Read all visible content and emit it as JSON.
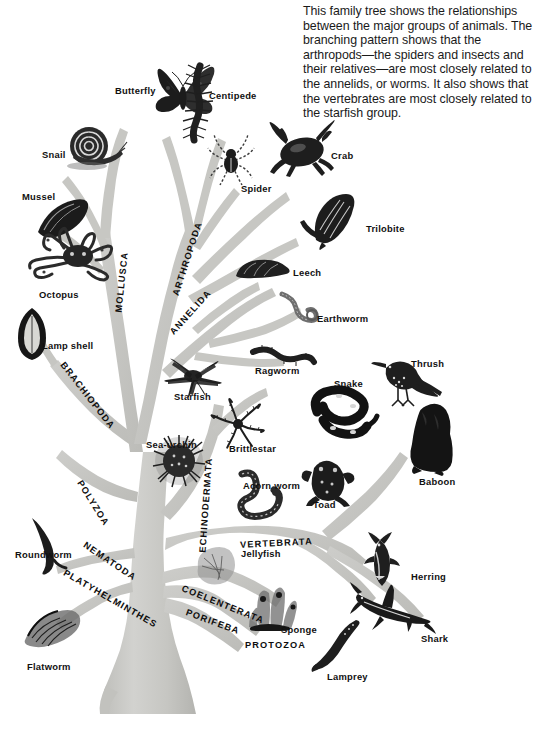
{
  "caption": {
    "text": "This family tree shows the relationships\nbetween the major groups of animals. The\nbranching pattern shows that the\narthropods—the spiders and insects and\ntheir relatives—are most closely related to\nthe annelids, or worms. It also shows that\nthe vertebrates are most closely related to\nthe starfish group."
  },
  "colors": {
    "background": "#ffffff",
    "trunk": "#c8c8c5",
    "trunk_shade": "#b6b6b2",
    "trunk_light": "#d6d6d3",
    "ink": "#1a1a1a",
    "label": "#111111"
  },
  "phyla": [
    {
      "name": "MOLLUSCA",
      "x": 119,
      "y": 308,
      "rotate": -84
    },
    {
      "name": "ARTHROPODA",
      "x": 176,
      "y": 291,
      "rotate": -72
    },
    {
      "name": "ANNELIDA",
      "x": 172,
      "y": 329,
      "rotate": -48
    },
    {
      "name": "BRACHIOPODA",
      "x": 62,
      "y": 359,
      "rotate": 52
    },
    {
      "name": "POLYZOA",
      "x": 79,
      "y": 477,
      "rotate": 58
    },
    {
      "name": "NEMATODA",
      "x": 84,
      "y": 540,
      "rotate": 34
    },
    {
      "name": "PLATYHELMINTHES",
      "x": 64,
      "y": 568,
      "rotate": 30
    },
    {
      "name": "ECHINODERMATA",
      "x": 203,
      "y": 548,
      "rotate": -86
    },
    {
      "name": "VERTEBRATA",
      "x": 240,
      "y": 541,
      "rotate": -3
    },
    {
      "name": "COELENTERATA",
      "x": 182,
      "y": 584,
      "rotate": 22
    },
    {
      "name": "PORIFEBA",
      "x": 186,
      "y": 608,
      "rotate": 20
    },
    {
      "name": "PROTOZOA",
      "x": 245,
      "y": 641,
      "rotate": 0
    }
  ],
  "animals": [
    {
      "name": "Butterfly",
      "label_x": 115,
      "label_y": 86,
      "art_x": 152,
      "art_y": 66,
      "art_w": 68,
      "art_h": 56,
      "kind": "butterfly"
    },
    {
      "name": "Centipede",
      "label_x": 209,
      "label_y": 91,
      "art_x": 178,
      "art_y": 68,
      "art_w": 36,
      "art_h": 72,
      "kind": "centipede"
    },
    {
      "name": "Snail",
      "label_x": 42,
      "label_y": 150,
      "art_x": 65,
      "art_y": 126,
      "art_w": 62,
      "art_h": 46,
      "kind": "snail"
    },
    {
      "name": "Spider",
      "label_x": 241,
      "label_y": 184,
      "art_x": 208,
      "art_y": 134,
      "art_w": 46,
      "art_h": 54,
      "kind": "spider"
    },
    {
      "name": "Crab",
      "label_x": 331,
      "label_y": 151,
      "art_x": 270,
      "art_y": 122,
      "art_w": 62,
      "art_h": 54,
      "kind": "crab"
    },
    {
      "name": "Mussel",
      "label_x": 22,
      "label_y": 192,
      "art_x": 36,
      "art_y": 198,
      "art_w": 56,
      "art_h": 42,
      "kind": "mussel"
    },
    {
      "name": "Trilobite",
      "label_x": 366,
      "label_y": 224,
      "art_x": 303,
      "art_y": 196,
      "art_w": 56,
      "art_h": 52,
      "kind": "trilobite"
    },
    {
      "name": "Octopus",
      "label_x": 39,
      "label_y": 290,
      "art_x": 27,
      "art_y": 232,
      "art_w": 88,
      "art_h": 60,
      "kind": "octopus"
    },
    {
      "name": "Leech",
      "label_x": 293,
      "label_y": 268,
      "art_x": 232,
      "art_y": 258,
      "art_w": 58,
      "art_h": 26,
      "kind": "leech"
    },
    {
      "name": "Earthworm",
      "label_x": 317,
      "label_y": 314,
      "art_x": 279,
      "art_y": 294,
      "art_w": 44,
      "art_h": 34,
      "kind": "earthworm"
    },
    {
      "name": "Lamp shell",
      "label_x": 42,
      "label_y": 341,
      "art_x": 18,
      "art_y": 310,
      "art_w": 30,
      "art_h": 52,
      "kind": "lampshell"
    },
    {
      "name": "Ragworm",
      "label_x": 255,
      "label_y": 366,
      "art_x": 253,
      "art_y": 347,
      "art_w": 62,
      "art_h": 24,
      "kind": "ragworm"
    },
    {
      "name": "Thrush",
      "label_x": 411,
      "label_y": 359,
      "art_x": 374,
      "art_y": 358,
      "art_w": 68,
      "art_h": 52,
      "kind": "thrush"
    },
    {
      "name": "Starfish",
      "label_x": 174,
      "label_y": 392,
      "art_x": 168,
      "art_y": 358,
      "art_w": 52,
      "art_h": 38,
      "kind": "starfish"
    },
    {
      "name": "Snake",
      "label_x": 334,
      "label_y": 379,
      "art_x": 309,
      "art_y": 388,
      "art_w": 66,
      "art_h": 56,
      "kind": "snake"
    },
    {
      "name": "Sea-urchin",
      "label_x": 146,
      "label_y": 440,
      "art_x": 152,
      "art_y": 436,
      "art_w": 52,
      "art_h": 52,
      "kind": "seaurchin"
    },
    {
      "name": "Brittlestar",
      "label_x": 229,
      "label_y": 444,
      "art_x": 211,
      "art_y": 398,
      "art_w": 54,
      "art_h": 50,
      "kind": "brittlestar"
    },
    {
      "name": "Baboon",
      "label_x": 419,
      "label_y": 477,
      "art_x": 404,
      "art_y": 405,
      "art_w": 56,
      "art_h": 68,
      "kind": "baboon"
    },
    {
      "name": "Acorn  worm",
      "label_x": 243,
      "label_y": 481,
      "art_x": 229,
      "art_y": 472,
      "art_w": 62,
      "art_h": 52,
      "kind": "acornworm"
    },
    {
      "name": "Toad",
      "label_x": 313,
      "label_y": 500,
      "art_x": 303,
      "art_y": 455,
      "art_w": 52,
      "art_h": 52,
      "kind": "toad"
    },
    {
      "name": "Roundworm",
      "label_x": 15,
      "label_y": 550,
      "art_x": 25,
      "art_y": 518,
      "art_w": 48,
      "art_h": 58,
      "kind": "roundworm"
    },
    {
      "name": "Herring",
      "label_x": 411,
      "label_y": 572,
      "art_x": 358,
      "art_y": 536,
      "art_w": 48,
      "art_h": 54,
      "kind": "herring"
    },
    {
      "name": "Jellyfish",
      "label_x": 241,
      "label_y": 549,
      "art_x": 193,
      "art_y": 548,
      "art_w": 44,
      "art_h": 38,
      "kind": "jellyfish"
    },
    {
      "name": "Flatworm",
      "label_x": 27,
      "label_y": 662,
      "art_x": 24,
      "art_y": 606,
      "art_w": 58,
      "art_h": 46,
      "kind": "flatworm"
    },
    {
      "name": "Sponge",
      "label_x": 281,
      "label_y": 625,
      "art_x": 246,
      "art_y": 587,
      "art_w": 54,
      "art_h": 44,
      "kind": "sponge"
    },
    {
      "name": "Shark",
      "label_x": 421,
      "label_y": 634,
      "art_x": 353,
      "art_y": 584,
      "art_w": 78,
      "art_h": 52,
      "kind": "shark"
    },
    {
      "name": "Lamprey",
      "label_x": 327,
      "label_y": 672,
      "art_x": 313,
      "art_y": 620,
      "art_w": 48,
      "art_h": 54,
      "kind": "lamprey"
    }
  ]
}
